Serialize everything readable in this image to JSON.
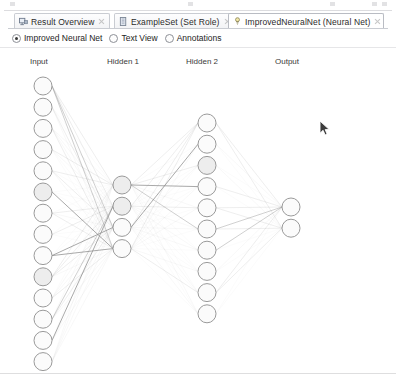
{
  "window": {
    "background_color": "#ffffff",
    "border_color": "#dcdcdf"
  },
  "tabs": [
    {
      "label": "Result Overview",
      "icon": "result-overview-icon",
      "active": false,
      "closable": true,
      "x": 14,
      "width": 96
    },
    {
      "label": "ExampleSet (Set Role)",
      "icon": "exampleset-icon",
      "active": false,
      "closable": true,
      "x": 114,
      "width": 118
    },
    {
      "label": "ImprovedNeuralNet (Neural Net)",
      "icon": "neural-net-icon",
      "active": true,
      "closable": true,
      "x": 228,
      "width": 156
    }
  ],
  "view_toolbar": {
    "options": [
      {
        "label": "Improved Neural Net",
        "selected": true
      },
      {
        "label": "Text View",
        "selected": false
      },
      {
        "label": "Annotations",
        "selected": false
      }
    ]
  },
  "chart_data": {
    "type": "diagram",
    "diagram_kind": "neural-network-graph",
    "title": "Improved Neural Net",
    "node_fill": "#fbfbfb",
    "node_stroke": "#9a9a9a",
    "edge_color": "#8d8d8d",
    "layers": [
      {
        "name": "Input",
        "label_x": 30,
        "label_y": 9,
        "node_count": 14,
        "node_x": 43,
        "node_r": 9,
        "first_y": 38,
        "spacing": 21.2
      },
      {
        "name": "Hidden 1",
        "label_x": 107,
        "label_y": 9,
        "node_count": 4,
        "node_x": 122,
        "node_r": 9,
        "first_y": 137,
        "spacing": 21.2
      },
      {
        "name": "Hidden 2",
        "label_x": 186,
        "label_y": 9,
        "node_count": 10,
        "node_x": 207,
        "node_r": 9,
        "first_y": 75,
        "spacing": 21.2
      },
      {
        "name": "Output",
        "label_x": 275,
        "label_y": 9,
        "node_count": 2,
        "node_x": 291,
        "node_r": 9,
        "first_y": 159,
        "spacing": 21.2
      }
    ]
  },
  "cursor": {
    "name": "mouse-pointer",
    "x": 319,
    "y": 120
  }
}
